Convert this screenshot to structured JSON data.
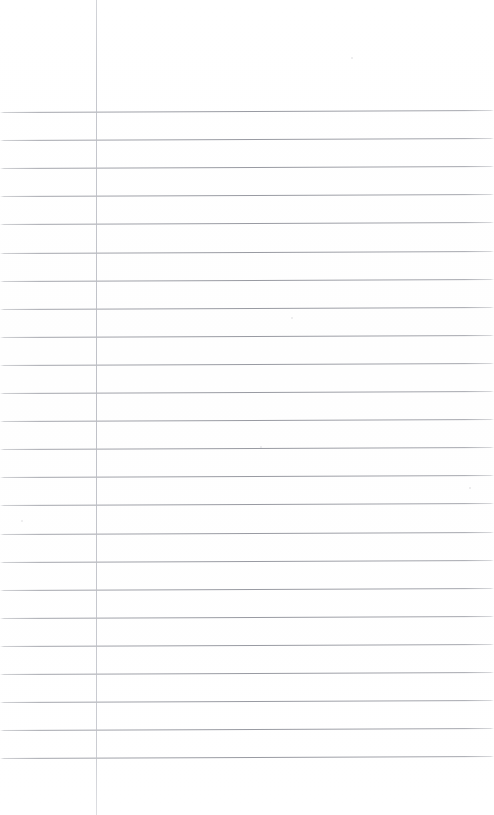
{
  "document": {
    "kind": "ruled-notebook-page",
    "description": "Blank lined notebook paper scan",
    "content_text": "",
    "page_width": 494,
    "page_height": 815,
    "background_color": "#ffffff"
  },
  "ruling": {
    "line_color": "#92949c",
    "line_count": 24,
    "first_line_y": 112,
    "line_spacing": 28.1,
    "line_thickness": 1,
    "skew_degrees": -0.22,
    "left_inset": 0,
    "right_extent": 494
  },
  "margin_rule": {
    "label": "vertical-margin-line",
    "x": 96,
    "color": "#bcbec5",
    "thickness": 1,
    "top": 0,
    "bottom": 815
  },
  "specks": [
    {
      "x": 292,
      "y": 318,
      "r": 1.1
    },
    {
      "x": 261,
      "y": 447,
      "r": 0.9
    },
    {
      "x": 22,
      "y": 521,
      "r": 1.0
    },
    {
      "x": 470,
      "y": 488,
      "r": 0.8
    },
    {
      "x": 352,
      "y": 58,
      "r": 0.8
    }
  ]
}
